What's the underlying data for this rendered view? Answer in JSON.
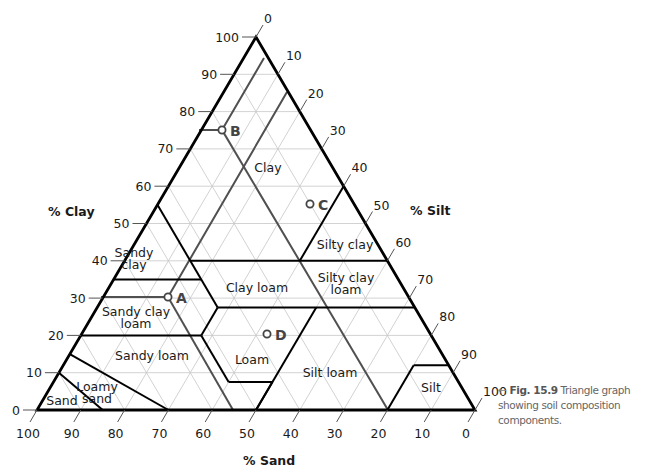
{
  "caption": {
    "arrow": "←",
    "figure_label": "Fig. 15.9",
    "text": " Triangle graph showing soil composition components."
  },
  "axes": {
    "clay_label": "% Clay",
    "silt_label": "% Silt",
    "sand_label": "% Sand"
  },
  "chart_data": {
    "type": "ternary",
    "title": "Triangle graph showing soil composition components",
    "axes": {
      "left": {
        "label": "% Clay",
        "ticks": [
          0,
          10,
          20,
          30,
          40,
          50,
          60,
          70,
          80,
          90,
          100
        ]
      },
      "right": {
        "label": "% Silt",
        "ticks": [
          0,
          10,
          20,
          30,
          40,
          50,
          60,
          70,
          80,
          90,
          100
        ]
      },
      "bottom": {
        "label": "% Sand",
        "ticks": [
          100,
          90,
          80,
          70,
          60,
          50,
          40,
          30,
          20,
          10,
          0
        ]
      }
    },
    "grid": true,
    "grid_step": 10,
    "regions": [
      {
        "name": "Clay",
        "label": [
          "Clay"
        ]
      },
      {
        "name": "Silty clay",
        "label": [
          "Silty clay"
        ]
      },
      {
        "name": "Sandy clay",
        "label": [
          "Sandy",
          "clay"
        ]
      },
      {
        "name": "Clay loam",
        "label": [
          "Clay loam"
        ]
      },
      {
        "name": "Silty clay loam",
        "label": [
          "Silty clay",
          "loam"
        ]
      },
      {
        "name": "Sandy clay loam",
        "label": [
          "Sandy clay",
          "loam"
        ]
      },
      {
        "name": "Loam",
        "label": [
          "Loam"
        ]
      },
      {
        "name": "Silt loam",
        "label": [
          "Silt loam"
        ]
      },
      {
        "name": "Sandy loam",
        "label": [
          "Sandy loam"
        ]
      },
      {
        "name": "Silt",
        "label": [
          "Silt"
        ]
      },
      {
        "name": "Loamy sand",
        "label": [
          "Loamy",
          "sand"
        ]
      },
      {
        "name": "Sand",
        "label": [
          "Sand"
        ]
      }
    ],
    "boundaries_sand_clay": [
      [
        [
          85,
          0
        ],
        [
          90,
          10
        ]
      ],
      [
        [
          70,
          0
        ],
        [
          85,
          15
        ]
      ],
      [
        [
          80,
          20
        ],
        [
          52.5,
          20
        ]
      ],
      [
        [
          52.5,
          20
        ],
        [
          52.5,
          7.5
        ]
      ],
      [
        [
          52.5,
          7.5
        ],
        [
          42.5,
          7.5
        ]
      ],
      [
        [
          42.5,
          7.5
        ],
        [
          50,
          0
        ]
      ],
      [
        [
          52.5,
          20
        ],
        [
          45,
          27.5
        ]
      ],
      [
        [
          45,
          27.5
        ],
        [
          0,
          27.5
        ]
      ],
      [
        [
          22.5,
          27.5
        ],
        [
          50,
          0
        ]
      ],
      [
        [
          45,
          40
        ],
        [
          0,
          40
        ]
      ],
      [
        [
          0,
          60
        ],
        [
          20,
          40
        ]
      ],
      [
        [
          45,
          27.5
        ],
        [
          45,
          55
        ]
      ],
      [
        [
          65,
          35
        ],
        [
          45,
          35
        ]
      ],
      [
        [
          20,
          0
        ],
        [
          8,
          12
        ]
      ],
      [
        [
          8,
          12
        ],
        [
          0,
          12
        ]
      ]
    ],
    "points": [
      {
        "label": "A",
        "sand": 55,
        "silt": 15,
        "clay": 30
      },
      {
        "label": "B",
        "sand": 20,
        "silt": 5,
        "clay": 75
      },
      {
        "label": "C",
        "sand": 10,
        "silt": 35,
        "clay": 55
      },
      {
        "label": "D",
        "sand": 40,
        "silt": 40,
        "clay": 20
      }
    ]
  },
  "region_labels": [
    {
      "lines": [
        "Clay"
      ],
      "x": 268,
      "y": 172
    },
    {
      "lines": [
        "Silty clay"
      ],
      "x": 345,
      "y": 249
    },
    {
      "lines": [
        "Silty clay",
        "loam"
      ],
      "x": 346,
      "y": 282
    },
    {
      "lines": [
        "Sandy",
        "clay"
      ],
      "x": 134,
      "y": 257
    },
    {
      "lines": [
        "Clay loam"
      ],
      "x": 257,
      "y": 292
    },
    {
      "lines": [
        "Sandy clay",
        "loam"
      ],
      "x": 136,
      "y": 316
    },
    {
      "lines": [
        "Loam"
      ],
      "x": 252,
      "y": 364
    },
    {
      "lines": [
        "Sandy loam"
      ],
      "x": 152,
      "y": 360
    },
    {
      "lines": [
        "Silt loam"
      ],
      "x": 330,
      "y": 377
    },
    {
      "lines": [
        "Silt"
      ],
      "x": 431,
      "y": 392
    },
    {
      "lines": [
        "Loamy",
        "sand"
      ],
      "x": 97,
      "y": 391
    },
    {
      "lines": [
        "Sand"
      ],
      "x": 62,
      "y": 405
    }
  ],
  "points_px": [
    {
      "label": "A",
      "x": 168,
      "y": 297
    },
    {
      "label": "B",
      "x": 222,
      "y": 130
    },
    {
      "label": "C",
      "x": 310,
      "y": 204
    },
    {
      "label": "D",
      "x": 267,
      "y": 334
    }
  ],
  "guides_px": [
    [
      [
        264,
        58
      ],
      [
        222,
        130
      ],
      [
        199,
        130
      ]
    ],
    [
      [
        222,
        130
      ],
      [
        388,
        410
      ]
    ],
    [
      [
        287,
        92
      ],
      [
        168,
        297
      ],
      [
        101,
        297
      ]
    ],
    [
      [
        168,
        297
      ],
      [
        233,
        410
      ]
    ]
  ],
  "colors": {
    "edge": "#000000",
    "grid": "#c6c6c6",
    "guide": "#505050",
    "text": "#1a1a1a",
    "caption": "#666666"
  }
}
